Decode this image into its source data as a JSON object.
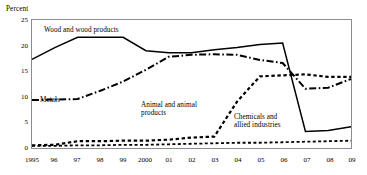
{
  "chart_data": {
    "type": "line",
    "title": "",
    "xlabel": "",
    "ylabel": "Percent",
    "ylim": [
      0,
      25
    ],
    "yticks": [
      0,
      5,
      10,
      15,
      20,
      25
    ],
    "ytick_labels": [
      "0",
      "5",
      "10",
      "15",
      "20",
      "25"
    ],
    "grid": false,
    "legend_position": "inline-annotations",
    "x": [
      1995,
      1996,
      1997,
      1998,
      1999,
      2000,
      2001,
      2002,
      2003,
      2004,
      2005,
      2006,
      2007,
      2008,
      2009
    ],
    "xtick_labels": [
      "1995",
      "96",
      "97",
      "98",
      "99",
      "2000",
      "01",
      "02",
      "03",
      "04",
      "05",
      "06",
      "07",
      "08",
      "09"
    ],
    "series": [
      {
        "name": "Wood and wood products",
        "style": "solid",
        "values": [
          17.3,
          19.6,
          21.6,
          21.6,
          21.6,
          19.0,
          18.6,
          18.6,
          19.2,
          19.6,
          20.2,
          20.5,
          3.3,
          3.5,
          4.2
        ]
      },
      {
        "name": "Metals",
        "style": "dash-dot",
        "values": [
          9.4,
          9.5,
          9.6,
          11.2,
          13.0,
          15.3,
          17.8,
          18.2,
          18.3,
          18.2,
          17.2,
          16.6,
          11.6,
          11.8,
          13.5
        ]
      },
      {
        "name": "Animal and animal products",
        "style": "dotted",
        "values": [
          0.6,
          0.7,
          1.4,
          1.4,
          1.5,
          1.5,
          1.7,
          2.1,
          2.3,
          9.1,
          14.0,
          14.2,
          14.4,
          13.9,
          13.9
        ]
      },
      {
        "name": "Chemicals and allied industries",
        "style": "dashed-fine",
        "values": [
          0.5,
          0.5,
          0.6,
          0.6,
          0.7,
          0.7,
          0.8,
          0.9,
          1.0,
          1.1,
          1.1,
          1.2,
          1.3,
          1.4,
          1.5
        ]
      }
    ]
  },
  "labels": {
    "percent": "Percent",
    "wood": "Wood and wood products",
    "metals": "Metals",
    "animal_line1": "Animal and animal",
    "animal_line2": "products",
    "chem_line1": "Chemicals and",
    "chem_line2": "allied industries"
  },
  "colors": {
    "line": "#000000",
    "frame": "#8c8c8c",
    "background": "#ffffff"
  }
}
